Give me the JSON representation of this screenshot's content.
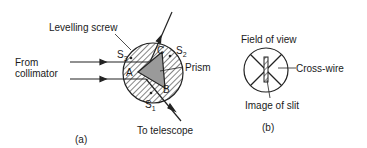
{
  "figure_a": {
    "caption": "(a)",
    "labels": {
      "levelling_screw": "Levelling screw",
      "from_collimator_line1": "From",
      "from_collimator_line2": "collimator",
      "prism": "Prism",
      "to_telescope": "To telescope",
      "vertex_a": "A",
      "vertex_b": "B",
      "vertex_c": "C",
      "screw_s1": "S",
      "screw_s1_sub": "1",
      "screw_s2": "S",
      "screw_s2_sub": "2",
      "screw_s3": "S",
      "screw_s3_sub": "3"
    }
  },
  "figure_b": {
    "caption": "(b)",
    "labels": {
      "field_of_view": "Field of view",
      "cross_wire": "Cross-wire",
      "image_of_slit": "Image of slit"
    }
  }
}
